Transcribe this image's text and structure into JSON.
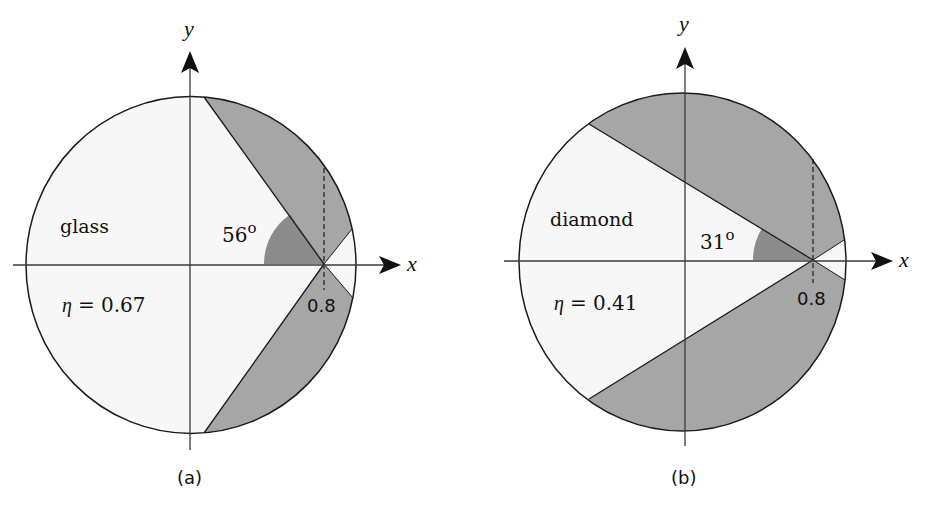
{
  "colors": {
    "background": "#ffffff",
    "light_region": "#f7f7f7",
    "shaded_region": "#a6a6a6",
    "angle_sector": "#8c8c8c",
    "line": "#1a1a1a"
  },
  "panels": [
    {
      "id": "a",
      "caption": "(a)",
      "material": "glass",
      "efficiency_label": "η = 0.67",
      "eta_symbol": "η",
      "eta_value": "= 0.67",
      "angle_label": "56",
      "angle_degree_mark": "o",
      "angle_deg": 56,
      "source_position_label": "0.8",
      "x_axis_label": "x",
      "y_axis_label": "y"
    },
    {
      "id": "b",
      "caption": "(b)",
      "material": "diamond",
      "efficiency_label": "η = 0.41",
      "eta_symbol": "η",
      "eta_value": "= 0.41",
      "angle_label": "31",
      "angle_degree_mark": "o",
      "angle_deg": 31,
      "source_position_label": "0.8",
      "x_axis_label": "x",
      "y_axis_label": "y"
    }
  ]
}
